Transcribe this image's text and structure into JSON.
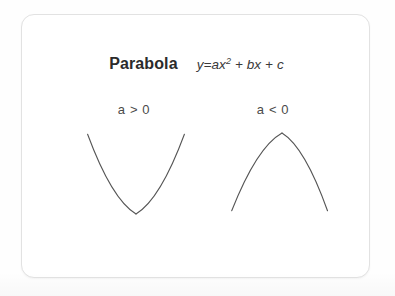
{
  "card": {
    "title": "Parabola",
    "formula_text": "y=ax² + bx + c",
    "formula_main": "y=ax",
    "formula_exponent": "2",
    "formula_rest": " + bx + c",
    "border_color": "#e2e2e2",
    "background_color": "#ffffff"
  },
  "labels": {
    "left_condition": "a > 0",
    "right_condition": "a < 0"
  },
  "diagram": {
    "stroke_color": "#555555",
    "stroke_width": 1.1,
    "left_curve_name": "upward-parabola",
    "right_curve_name": "downward-parabola",
    "left_curve_direction": "opens-upward",
    "right_curve_direction": "opens-downward",
    "arrowhead_count": 4
  },
  "chart_data": {
    "type": "line",
    "title": "Parabola",
    "annotations": [
      "y=ax² + bx + c",
      "a > 0",
      "a < 0"
    ],
    "xlabel": "",
    "ylabel": "",
    "grid": false,
    "legend": "none",
    "series": [
      {
        "name": "a > 0",
        "description": "Upward opening parabola, arrows at both upper ends",
        "vertex": [
          135,
          213
        ],
        "endpoints": [
          [
            84,
            129
          ],
          [
            186,
            129
          ]
        ],
        "x": [
          84,
          95,
          106,
          116,
          125,
          135,
          145,
          154,
          164,
          175,
          186
        ],
        "y": [
          129,
          153,
          173,
          190,
          204,
          213,
          204,
          190,
          173,
          153,
          129
        ]
      },
      {
        "name": "a < 0",
        "description": "Downward opening parabola, arrows at both lower ends",
        "vertex": [
          281,
          132
        ],
        "endpoints": [
          [
            228,
            214
          ],
          [
            329,
            214
          ]
        ],
        "x": [
          228,
          239,
          249,
          259,
          270,
          281,
          292,
          302,
          312,
          322,
          329
        ],
        "y": [
          214,
          188,
          168,
          152,
          139,
          132,
          139,
          152,
          168,
          188,
          214
        ]
      }
    ]
  }
}
